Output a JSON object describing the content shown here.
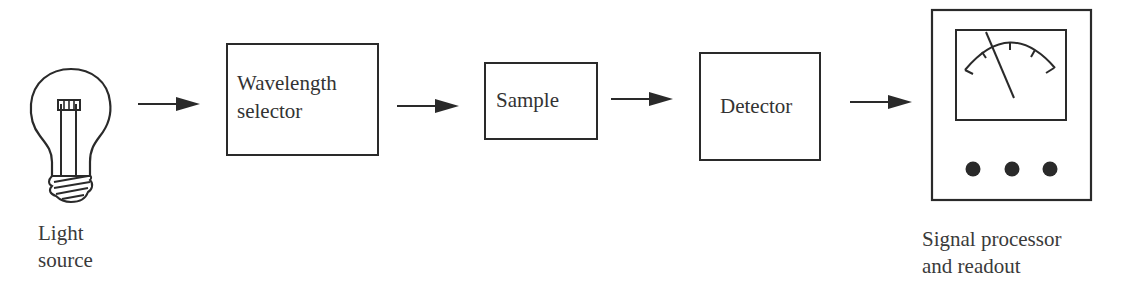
{
  "diagram": {
    "type": "block-flow",
    "direction": "left-to-right",
    "stages": [
      {
        "id": "light-source",
        "kind": "icon",
        "icon": "light-bulb-icon",
        "label_lines": [
          "Light",
          "source"
        ]
      },
      {
        "id": "wavelength-selector",
        "kind": "box",
        "label_lines": [
          "Wavelength",
          "selector"
        ]
      },
      {
        "id": "sample",
        "kind": "box",
        "label_lines": [
          "Sample"
        ]
      },
      {
        "id": "detector",
        "kind": "box",
        "label_lines": [
          "Detector"
        ]
      },
      {
        "id": "signal-processor",
        "kind": "icon",
        "icon": "meter-readout-icon",
        "label_lines": [
          "Signal processor",
          "and readout"
        ]
      }
    ],
    "arrows": [
      {
        "from": "light-source",
        "to": "wavelength-selector"
      },
      {
        "from": "wavelength-selector",
        "to": "sample"
      },
      {
        "from": "sample",
        "to": "detector"
      },
      {
        "from": "detector",
        "to": "signal-processor"
      }
    ],
    "colors": {
      "stroke": "#2a2a2a",
      "background": "#ffffff",
      "text": "#333333"
    }
  }
}
